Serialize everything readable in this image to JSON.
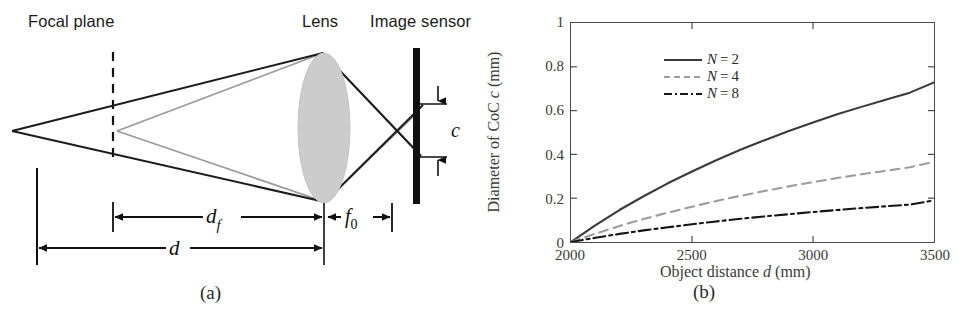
{
  "figure": {
    "panel_a": {
      "labels": {
        "focal_plane": "Focal plane",
        "lens": "Lens",
        "image_sensor": "Image sensor"
      },
      "dimension_labels": {
        "d_f": "d",
        "d_f_sub": "f",
        "d": "d",
        "f0": "f",
        "f0_sub": "0",
        "coc": "c"
      },
      "caption": "(a)",
      "colors": {
        "ray_dark": "#1c1c1c",
        "ray_light": "#9a9a9a",
        "lens_fill": "#cccccc",
        "sensor": "#111111",
        "dimension_line": "#111111"
      }
    },
    "panel_b": {
      "caption": "(b)",
      "colors": {
        "axis": "#4a4a4a",
        "series_n2": "#3a3a3a",
        "series_n4": "#9c9c9c",
        "series_n8": "#141414"
      },
      "chart_data": {
        "type": "line",
        "title": "",
        "xlabel": "Object distance d (mm)",
        "ylabel": "Diameter of CoC c (mm)",
        "xlim": [
          2000,
          3500
        ],
        "ylim": [
          0,
          1
        ],
        "xticks": [
          2000,
          2500,
          3000,
          3500
        ],
        "xtick_labels": [
          "2000",
          "2500",
          "3000",
          "3500"
        ],
        "yticks": [
          0,
          0.2,
          0.4,
          0.6,
          0.8,
          1
        ],
        "ytick_labels": [
          "0",
          "0.2",
          "0.4",
          "0.6",
          "0.8",
          "1"
        ],
        "grid": false,
        "legend_position": "upper left",
        "x": [
          2000,
          2100,
          2200,
          2300,
          2400,
          2500,
          2600,
          2700,
          2800,
          2900,
          3000,
          3100,
          3200,
          3300,
          3400,
          3500
        ],
        "series": [
          {
            "name": "N = 2",
            "label_var": "N",
            "label_eq": "=",
            "label_value": "2",
            "style": "solid",
            "color": "#3a3a3a",
            "values": [
              0.0,
              0.076,
              0.146,
              0.209,
              0.268,
              0.322,
              0.373,
              0.421,
              0.465,
              0.507,
              0.546,
              0.583,
              0.617,
              0.65,
              0.682,
              0.729
            ]
          },
          {
            "name": "N = 4",
            "label_var": "N",
            "label_eq": "=",
            "label_value": "4",
            "style": "dashed",
            "color": "#9c9c9c",
            "values": [
              0.0,
              0.038,
              0.073,
              0.105,
              0.134,
              0.161,
              0.187,
              0.211,
              0.233,
              0.254,
              0.273,
              0.292,
              0.309,
              0.325,
              0.341,
              0.366
            ]
          },
          {
            "name": "N = 8",
            "label_var": "N",
            "label_eq": "=",
            "label_value": "8",
            "style": "dashdot",
            "color": "#141414",
            "values": [
              0.0,
              0.019,
              0.037,
              0.053,
              0.067,
              0.081,
              0.094,
              0.106,
              0.117,
              0.127,
              0.137,
              0.146,
              0.155,
              0.163,
              0.171,
              0.19
            ]
          }
        ]
      }
    }
  }
}
